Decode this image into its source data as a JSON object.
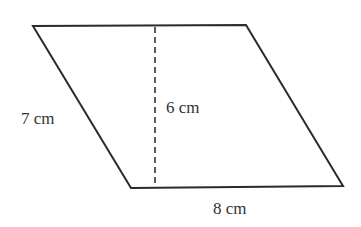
{
  "diagram": {
    "type": "geometry",
    "shape": "parallelogram",
    "colors": {
      "background": "#ffffff",
      "stroke": "#2b2b2b",
      "text": "#333333"
    },
    "vertices": {
      "top_left": [
        33,
        26
      ],
      "top_right": [
        246,
        25
      ],
      "bottom_right": [
        343,
        186
      ],
      "bottom_left": [
        131,
        188
      ]
    },
    "height_line": {
      "style": "dashed",
      "x": 155,
      "y_top": 26,
      "y_bottom": 187
    },
    "labels": {
      "side": "7 cm",
      "height": "6 cm",
      "base": "8 cm"
    },
    "measurements": {
      "side_length_cm": 7,
      "height_cm": 6,
      "base_cm": 8
    }
  }
}
